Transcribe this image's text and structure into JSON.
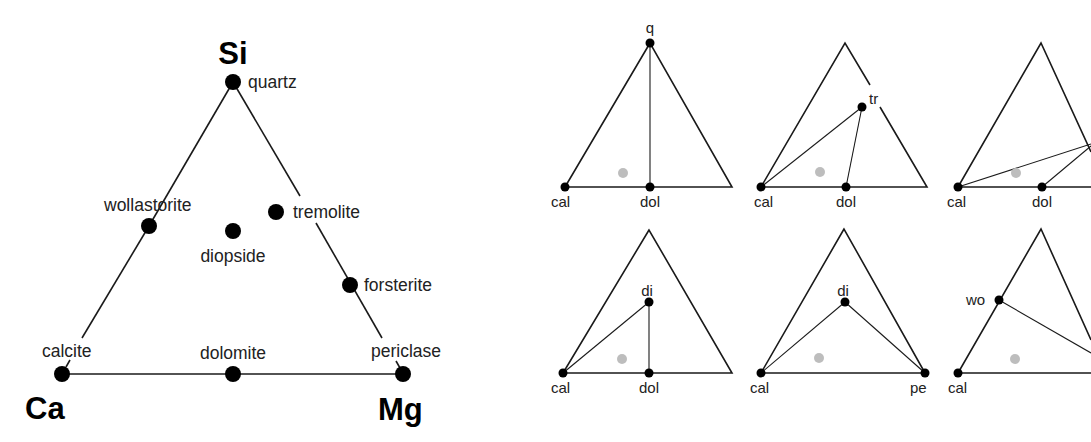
{
  "main_diagram": {
    "title": "Ca–Mg–Si ternary composition diagram",
    "corners": {
      "top": "Si",
      "left": "Ca",
      "right": "Mg"
    },
    "minerals": [
      {
        "name": "quartz",
        "x": 233,
        "y": 82
      },
      {
        "name": "wollastorite",
        "x": 149,
        "y": 226
      },
      {
        "name": "diopside",
        "x": 233,
        "y": 231
      },
      {
        "name": "tremolite",
        "x": 276,
        "y": 212
      },
      {
        "name": "forsterite",
        "x": 350,
        "y": 285
      },
      {
        "name": "calcite",
        "x": 62,
        "y": 374
      },
      {
        "name": "dolomite",
        "x": 233,
        "y": 374
      },
      {
        "name": "periclase",
        "x": 403,
        "y": 374
      }
    ]
  },
  "small_diagrams": [
    {
      "id": 1,
      "labels": {
        "top": "q",
        "left": "cal",
        "mid": "dol"
      },
      "tie_lines": [
        "cal-q",
        "dol-q"
      ]
    },
    {
      "id": 2,
      "labels": {
        "interior": "tr",
        "left": "cal",
        "mid": "dol"
      },
      "tie_lines": [
        "cal-tr",
        "dol-tr"
      ]
    },
    {
      "id": 3,
      "labels": {
        "left": "cal",
        "mid": "dol"
      },
      "tie_lines": [
        "cal-right-edge",
        "dol-right-edge"
      ]
    },
    {
      "id": 4,
      "labels": {
        "interior": "di",
        "left": "cal",
        "mid": "dol"
      },
      "tie_lines": [
        "cal-di",
        "dol-di"
      ]
    },
    {
      "id": 5,
      "labels": {
        "interior": "di",
        "left": "cal",
        "right": "pe"
      },
      "tie_lines": [
        "cal-di",
        "pe-di"
      ]
    },
    {
      "id": 6,
      "labels": {
        "edge": "wo",
        "left": "cal"
      },
      "tie_lines": [
        "wo-right-edge"
      ]
    }
  ],
  "colors": {
    "line": "#1a1a1a",
    "point": "#000000",
    "bulk_composition_point": "#bdbdbd"
  }
}
